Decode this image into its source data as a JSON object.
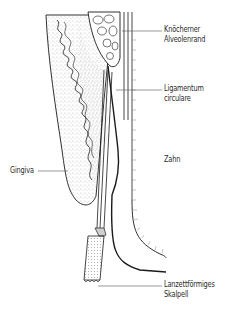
{
  "figure": {
    "labels": [
      {
        "id": "alveolar-bone",
        "lines": [
          "Knöcherner",
          "Alveolenrand"
        ]
      },
      {
        "id": "ligament",
        "lines": [
          "Ligamentum",
          "circulare"
        ]
      },
      {
        "id": "tooth",
        "lines": [
          "Zahn"
        ]
      },
      {
        "id": "gingiva",
        "lines": [
          "Gingiva"
        ]
      },
      {
        "id": "scalpel",
        "lines": [
          "Lanzettförmiges",
          "Skalpell"
        ]
      }
    ]
  },
  "colors": {
    "line": "#1a1a1a",
    "leader": "#555555",
    "stipple": "#8a8a8a",
    "scalpel_fill": "#cfcfcf"
  }
}
